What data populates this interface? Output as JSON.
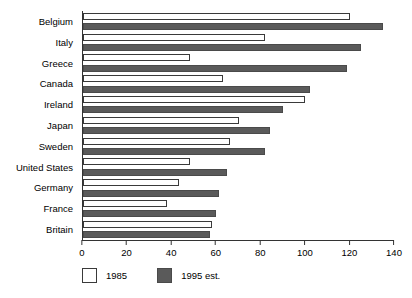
{
  "chart_data": {
    "type": "bar",
    "orientation": "horizontal",
    "title": "",
    "subtitle": "",
    "xlabel": "",
    "ylabel": "",
    "xlim": [
      0,
      140
    ],
    "xticks": [
      0,
      20,
      40,
      60,
      80,
      100,
      120,
      140
    ],
    "grid": false,
    "legend_position": "bottom-left",
    "categories": [
      "Belgium",
      "Italy",
      "Greece",
      "Canada",
      "Ireland",
      "Japan",
      "Sweden",
      "United States",
      "Germany",
      "France",
      "Britain"
    ],
    "series": [
      {
        "name": "1985",
        "color": "#ffffff",
        "values": [
          120,
          82,
          48,
          63,
          100,
          70,
          66,
          48,
          43,
          38,
          58
        ]
      },
      {
        "name": "1995 est.",
        "color": "#5a5a5a",
        "values": [
          135,
          125,
          119,
          102,
          90,
          84,
          82,
          65,
          61,
          60,
          57
        ]
      }
    ]
  },
  "legend": {
    "items": [
      {
        "label": "1985",
        "swatch": "white-square"
      },
      {
        "label": "1995 est.",
        "swatch": "dark-gray-square"
      }
    ]
  },
  "axis": {
    "x_tick_labels": [
      "0",
      "20",
      "40",
      "60",
      "80",
      "100",
      "120",
      "140"
    ]
  }
}
